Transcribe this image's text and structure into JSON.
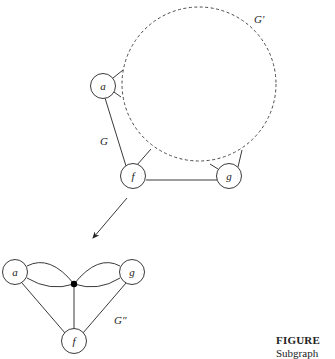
{
  "figure": {
    "caption_title": "FIGURE",
    "caption_text": "Subgraph"
  },
  "top_graph": {
    "label_graph": "G",
    "label_subgraph": "G′",
    "nodes": [
      {
        "id": "a",
        "label": "a"
      },
      {
        "id": "f",
        "label": "f"
      },
      {
        "id": "g",
        "label": "g"
      }
    ],
    "edges": [
      {
        "from": "a",
        "to": "f"
      },
      {
        "from": "f",
        "to": "g"
      }
    ]
  },
  "bottom_graph": {
    "label_graph": "G″",
    "nodes": [
      {
        "id": "a",
        "label": "a"
      },
      {
        "id": "g",
        "label": "g"
      },
      {
        "id": "f",
        "label": "f"
      },
      {
        "id": "center",
        "label": ""
      }
    ],
    "edges": [
      {
        "from": "a",
        "to": "center",
        "count": 2
      },
      {
        "from": "g",
        "to": "center",
        "count": 2
      },
      {
        "from": "f",
        "to": "center",
        "count": 1
      },
      {
        "from": "a",
        "to": "f",
        "count": 1
      },
      {
        "from": "g",
        "to": "f",
        "count": 1
      }
    ]
  },
  "colors": {
    "stroke": "#3a3a3a",
    "background": "#ffffff",
    "center_dot": "#000000"
  }
}
